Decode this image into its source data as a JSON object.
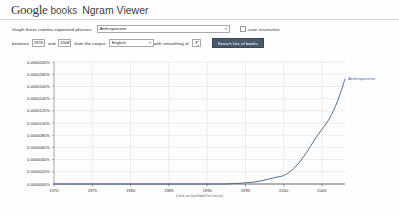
{
  "header": {
    "logo_google": "Google",
    "logo_books": "books",
    "title": "Ngram Viewer"
  },
  "form": {
    "phrases_label": "Graph these comma-separated phrases:",
    "phrases_value": "Anthropocene",
    "phrases_placeholder": "Enter phrases",
    "case_insensitive_label": "case-insensitive",
    "between_label": "between",
    "year_start": "1970",
    "and_label": "and",
    "year_end": "2008",
    "corpus_label": "from the corpus",
    "corpus_value": "English",
    "smoothing_label": "with smoothing of",
    "smoothing_value": "3",
    "search_button": "Search lots of books"
  },
  "chart_footnote": "(click on line/label for focus)",
  "chart_data": {
    "type": "line",
    "title": "",
    "xlabel": "",
    "ylabel": "",
    "grid": true,
    "legend_position": "right-inline",
    "xlim": [
      1970,
      2008
    ],
    "ylim": [
      0.0,
      2e-05
    ],
    "xticks": [
      1970,
      1975,
      1980,
      1985,
      1990,
      1995,
      2000,
      2005
    ],
    "xticklabels": [
      "1970",
      "1975",
      "1980",
      "1985",
      "1990",
      "1995",
      "2000",
      "2005"
    ],
    "yticks": [
      2e-05,
      1.8e-05,
      1.6e-05,
      1.4e-05,
      1.2e-05,
      1e-05,
      8e-06,
      6e-06,
      4e-06,
      2e-06,
      0.0
    ],
    "yticklabels": [
      "0.0000200%",
      "0.0000180%",
      "0.0000160%",
      "0.0000140%",
      "0.0000120%",
      "0.0000100%",
      "0.0000080%",
      "0.0000060%",
      "0.0000040%",
      "0.0000020%",
      "0.0000000%"
    ],
    "series": [
      {
        "name": "Anthropocene",
        "color": "#3d5f8f",
        "x": [
          1970,
          1972,
          1974,
          1976,
          1978,
          1980,
          1982,
          1984,
          1986,
          1988,
          1990,
          1992,
          1994,
          1995,
          1996,
          1997,
          1998,
          1999,
          2000,
          2001,
          2002,
          2003,
          2004,
          2005,
          2006,
          2007,
          2008
        ],
        "values": [
          0.0,
          0.0,
          0.0,
          0.0,
          0.0,
          0.0,
          0.0,
          0.0,
          0.0,
          0.0,
          0.0,
          0.0,
          1e-07,
          2e-07,
          3e-07,
          5e-07,
          8e-07,
          1.1e-06,
          1.4e-06,
          2.2e-06,
          3.5e-06,
          5.2e-06,
          7.2e-06,
          9e-06,
          1.08e-05,
          1.35e-05,
          1.72e-05
        ]
      }
    ]
  }
}
